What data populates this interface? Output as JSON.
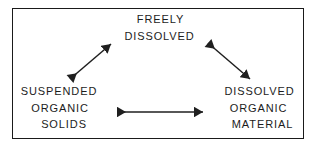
{
  "figure": {
    "background_color": "#ffffff",
    "border_color": "#1a1a1a",
    "text_color": "#1c1c1c",
    "arrow_color": "#1f1f1f"
  },
  "nodes": {
    "top": {
      "name": "freely-dissolved",
      "lines": [
        "FREELY",
        "DISSOLVED"
      ]
    },
    "bottom_left": {
      "name": "suspended-organic-solids",
      "lines": [
        "SUSPENDED",
        "ORGANIC",
        "SOLIDS"
      ]
    },
    "bottom_right": {
      "name": "dissolved-organic-material",
      "lines": [
        "DISSOLVED",
        "ORGANIC",
        "MATERIAL"
      ]
    }
  },
  "arrows": [
    {
      "name": "arrow-suspended-to-freely",
      "from": "suspended-organic-solids",
      "to": "freely-dissolved",
      "direction": "bidirectional",
      "x1": 69,
      "y1": 80,
      "x2": 112,
      "y2": 43
    },
    {
      "name": "arrow-freely-to-dissolved",
      "from": "freely-dissolved",
      "to": "dissolved-organic-material",
      "direction": "bidirectional",
      "x1": 207,
      "y1": 42,
      "x2": 251,
      "y2": 80
    },
    {
      "name": "arrow-suspended-to-dissolved",
      "from": "suspended-organic-solids",
      "to": "dissolved-organic-material",
      "direction": "bidirectional",
      "x1": 115,
      "y1": 112,
      "x2": 204,
      "y2": 112
    }
  ]
}
